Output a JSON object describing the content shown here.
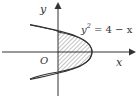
{
  "diagram": {
    "equation": "y² = 4 − x",
    "equation_base": "y",
    "equation_exp": "2",
    "equation_rhs": " = 4 − x",
    "axis_x_label": "x",
    "axis_y_label": "y",
    "origin_label": "O",
    "colors": {
      "line": "#333333",
      "hatch": "#555555",
      "background": "#ffffff"
    },
    "shaded_region": "area between parabola y² = 4 − x and the y-axis (x ≥ 0)"
  }
}
